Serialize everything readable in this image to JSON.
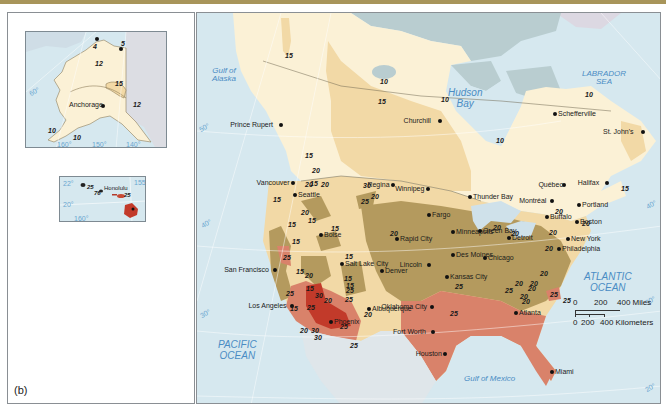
{
  "figure": {
    "panel_label": "(b)",
    "header_bar_color": "#a8955a"
  },
  "colors": {
    "water": "#d6e8ef",
    "land_outside": "#b9cdd0",
    "zone_10": "#fbf1d6",
    "zone_15": "#f2d9a6",
    "zone_20": "#b49a5e",
    "zone_25": "#d9826a",
    "zone_30": "#c23a2a",
    "greenland": "#dcd8e2",
    "label_water": "#4a8cc4",
    "graticule": "#ffffff"
  },
  "alaska_inset": {
    "city": "Anchorage",
    "values": [
      "4",
      "5",
      "12",
      "15",
      "12",
      "10",
      "10"
    ],
    "longitudes": [
      "160°",
      "150°",
      "140°"
    ],
    "latitude": "60°"
  },
  "hawaii_inset": {
    "city": "Honolulu",
    "values": [
      "25",
      "76",
      "25"
    ],
    "latitudes": [
      "22°",
      "20°"
    ],
    "longitudes": [
      "160°",
      "155°"
    ]
  },
  "water_labels": {
    "gulf_of_alaska": "Gulf of\nAlaska",
    "hudson_bay": "Hudson\nBay",
    "labrador_sea": "LABRADOR\nSEA",
    "pacific_ocean": "PACIFIC\nOCEAN",
    "atlantic_ocean": "ATLANTIC\nOCEAN",
    "gulf_of_mexico": "Gulf of Mexico"
  },
  "latitudes": {
    "left": [
      "50°",
      "40°",
      "30°"
    ],
    "right": [
      "40°",
      "30°",
      "20°"
    ]
  },
  "cities": [
    {
      "name": "Prince Rupert",
      "x": 281,
      "y": 125
    },
    {
      "name": "Churchill",
      "x": 440,
      "y": 121
    },
    {
      "name": "Schefferville",
      "x": 555,
      "y": 114
    },
    {
      "name": "St. John's",
      "x": 643,
      "y": 132
    },
    {
      "name": "Vancouver",
      "x": 293,
      "y": 183
    },
    {
      "name": "Seattle",
      "x": 295,
      "y": 195
    },
    {
      "name": "Regina",
      "x": 393,
      "y": 185
    },
    {
      "name": "Winnipeg",
      "x": 428,
      "y": 189
    },
    {
      "name": "Thunder Bay",
      "x": 470,
      "y": 197
    },
    {
      "name": "Québec",
      "x": 564,
      "y": 185
    },
    {
      "name": "Halifax",
      "x": 607,
      "y": 183
    },
    {
      "name": "Montréal",
      "x": 552,
      "y": 201
    },
    {
      "name": "Portland",
      "x": 579,
      "y": 205
    },
    {
      "name": "Fargo",
      "x": 429,
      "y": 215
    },
    {
      "name": "Minneapolis",
      "x": 453,
      "y": 232
    },
    {
      "name": "Green Bay",
      "x": 480,
      "y": 231
    },
    {
      "name": "Buffalo",
      "x": 547,
      "y": 217
    },
    {
      "name": "Boston",
      "x": 577,
      "y": 222
    },
    {
      "name": "Boise",
      "x": 321,
      "y": 235
    },
    {
      "name": "Rapid City",
      "x": 397,
      "y": 239
    },
    {
      "name": "Detroit",
      "x": 509,
      "y": 238
    },
    {
      "name": "New York",
      "x": 568,
      "y": 239
    },
    {
      "name": "Salt Lake City",
      "x": 342,
      "y": 264
    },
    {
      "name": "Des Moines",
      "x": 453,
      "y": 255
    },
    {
      "name": "Chicago",
      "x": 485,
      "y": 258
    },
    {
      "name": "Philadelphia",
      "x": 559,
      "y": 249
    },
    {
      "name": "Lincoln",
      "x": 429,
      "y": 265
    },
    {
      "name": "San Francisco",
      "x": 275,
      "y": 270
    },
    {
      "name": "Denver",
      "x": 382,
      "y": 271
    },
    {
      "name": "Kansas City",
      "x": 447,
      "y": 277
    },
    {
      "name": "Oklahoma City",
      "x": 432,
      "y": 307
    },
    {
      "name": "Los Angeles",
      "x": 292,
      "y": 306
    },
    {
      "name": "Phoenix",
      "x": 331,
      "y": 322
    },
    {
      "name": "Albuquerque",
      "x": 369,
      "y": 309
    },
    {
      "name": "Atlanta",
      "x": 516,
      "y": 313
    },
    {
      "name": "Fort Worth",
      "x": 433,
      "y": 332
    },
    {
      "name": "Houston",
      "x": 445,
      "y": 354
    },
    {
      "name": "Miami",
      "x": 552,
      "y": 372
    }
  ],
  "isoline_values": [
    {
      "v": "15",
      "x": 285,
      "y": 52
    },
    {
      "v": "10",
      "x": 380,
      "y": 78
    },
    {
      "v": "15",
      "x": 378,
      "y": 98
    },
    {
      "v": "10",
      "x": 441,
      "y": 96
    },
    {
      "v": "10",
      "x": 496,
      "y": 137
    },
    {
      "v": "10",
      "x": 585,
      "y": 91
    },
    {
      "v": "15",
      "x": 621,
      "y": 185
    },
    {
      "v": "15",
      "x": 305,
      "y": 152
    },
    {
      "v": "20",
      "x": 312,
      "y": 167
    },
    {
      "v": "20",
      "x": 305,
      "y": 181
    },
    {
      "v": "15",
      "x": 310,
      "y": 180
    },
    {
      "v": "20",
      "x": 321,
      "y": 181
    },
    {
      "v": "15",
      "x": 273,
      "y": 196
    },
    {
      "v": "20",
      "x": 301,
      "y": 209
    },
    {
      "v": "15",
      "x": 308,
      "y": 217
    },
    {
      "v": "15",
      "x": 288,
      "y": 221
    },
    {
      "v": "15",
      "x": 331,
      "y": 225
    },
    {
      "v": "15",
      "x": 292,
      "y": 238
    },
    {
      "v": "25",
      "x": 283,
      "y": 254
    },
    {
      "v": "15",
      "x": 296,
      "y": 268
    },
    {
      "v": "20",
      "x": 305,
      "y": 272
    },
    {
      "v": "30",
      "x": 363,
      "y": 182
    },
    {
      "v": "20",
      "x": 371,
      "y": 193
    },
    {
      "v": "25",
      "x": 361,
      "y": 198
    },
    {
      "v": "20",
      "x": 390,
      "y": 230
    },
    {
      "v": "15",
      "x": 345,
      "y": 253
    },
    {
      "v": "15",
      "x": 306,
      "y": 285
    },
    {
      "v": "15",
      "x": 344,
      "y": 275
    },
    {
      "v": "25",
      "x": 286,
      "y": 290
    },
    {
      "v": "30",
      "x": 315,
      "y": 292
    },
    {
      "v": "20",
      "x": 324,
      "y": 297
    },
    {
      "v": "25",
      "x": 345,
      "y": 296
    },
    {
      "v": "15",
      "x": 346,
      "y": 282
    },
    {
      "v": "25",
      "x": 307,
      "y": 304
    },
    {
      "v": "15",
      "x": 290,
      "y": 305
    },
    {
      "v": "25",
      "x": 340,
      "y": 323
    },
    {
      "v": "20",
      "x": 300,
      "y": 327
    },
    {
      "v": "30",
      "x": 311,
      "y": 327
    },
    {
      "v": "30",
      "x": 314,
      "y": 334
    },
    {
      "v": "25",
      "x": 350,
      "y": 342
    },
    {
      "v": "20",
      "x": 364,
      "y": 311
    },
    {
      "v": "25",
      "x": 346,
      "y": 287
    },
    {
      "v": "25",
      "x": 455,
      "y": 283
    },
    {
      "v": "25",
      "x": 450,
      "y": 310
    },
    {
      "v": "20",
      "x": 493,
      "y": 224
    },
    {
      "v": "20",
      "x": 511,
      "y": 230
    },
    {
      "v": "20",
      "x": 549,
      "y": 229
    },
    {
      "v": "20",
      "x": 545,
      "y": 245
    },
    {
      "v": "20",
      "x": 540,
      "y": 270
    },
    {
      "v": "20",
      "x": 530,
      "y": 280
    },
    {
      "v": "20",
      "x": 528,
      "y": 285
    },
    {
      "v": "20",
      "x": 520,
      "y": 293
    },
    {
      "v": "20",
      "x": 522,
      "y": 298
    },
    {
      "v": "25",
      "x": 550,
      "y": 291
    },
    {
      "v": "25",
      "x": 563,
      "y": 297
    },
    {
      "v": "20",
      "x": 582,
      "y": 220
    },
    {
      "v": "20",
      "x": 555,
      "y": 208
    },
    {
      "v": "20",
      "x": 515,
      "y": 280
    },
    {
      "v": "25",
      "x": 505,
      "y": 287
    }
  ],
  "scale": {
    "miles_labels": [
      "0",
      "200",
      "400 Miles"
    ],
    "km_labels": [
      "0",
      "200",
      "400 Kilometers"
    ]
  }
}
